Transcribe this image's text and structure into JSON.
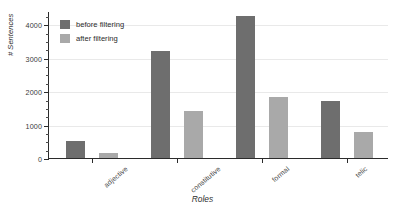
{
  "chart_data": {
    "type": "bar",
    "title": "",
    "xlabel": "Roles",
    "ylabel": "# Sentences",
    "categories": [
      "adjective",
      "constitutive",
      "formal",
      "telic"
    ],
    "series": [
      {
        "name": "before filtering",
        "color": "#6e6e6e",
        "values": [
          520,
          3200,
          4250,
          1700
        ]
      },
      {
        "name": "after filtering",
        "color": "#a9a9a9",
        "values": [
          160,
          1400,
          1820,
          780
        ]
      }
    ],
    "ylim": [
      0,
      4400
    ],
    "yticks": [
      0,
      1000,
      2000,
      3000,
      4000
    ],
    "ytick_labels": [
      "0",
      "1000",
      "2000",
      "3000",
      "4000"
    ],
    "yminor_step": 250,
    "grid": true,
    "legend_position": "upper-left"
  },
  "legend": {
    "items": [
      {
        "label": "before filtering"
      },
      {
        "label": "after filtering"
      }
    ]
  },
  "axes": {
    "x_title": "Roles",
    "y_title": "# Sentences"
  }
}
